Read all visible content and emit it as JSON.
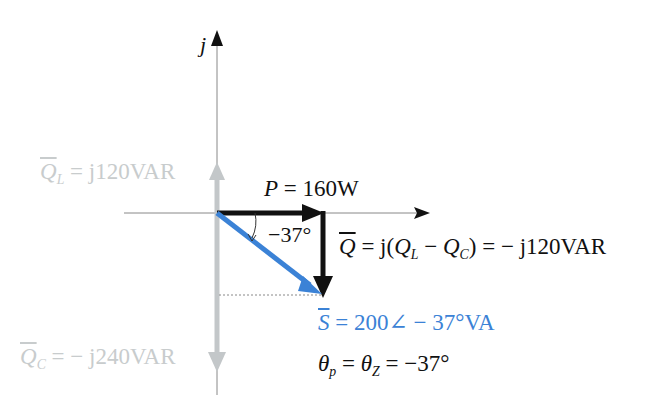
{
  "diagram": {
    "type": "phasor-power-triangle",
    "colors": {
      "axis": "#777777",
      "reactive_faint": "#c3c7c9",
      "apparent_power": "#3b82d6",
      "real_reactive": "#111111"
    },
    "axes": {
      "imag_label": "j"
    },
    "labels": {
      "QL": {
        "symbol": "Q",
        "sub": "L",
        "eq": " = ",
        "value": "j120VAR"
      },
      "QC": {
        "symbol": "Q",
        "sub": "C",
        "eq": " = ",
        "value": "− j240VAR"
      },
      "P": {
        "symbol": "P",
        "eq": " = ",
        "value": "160W"
      },
      "angle": "−37°",
      "Q": {
        "symbol": "Q",
        "eq": " = j(",
        "sub1": "L",
        "minus": " − ",
        "sub2": "C",
        "close": ") = − ",
        "value": "j120VAR",
        "q1": "Q",
        "q2": "Q"
      },
      "S": {
        "symbol": "S",
        "eq": " = 200∠ − 37°VA"
      },
      "theta": {
        "t1": "θ",
        "s1": "p",
        "eq1": " = ",
        "t2": "θ",
        "s2": "Z",
        "eq2": " = −37°"
      }
    },
    "values": {
      "P_W": 160,
      "QL_VAR": 120,
      "QC_VAR": -240,
      "Q_VAR": -120,
      "S_VA": 200,
      "S_angle_deg": -37,
      "theta_p_deg": -37,
      "theta_Z_deg": -37
    }
  }
}
